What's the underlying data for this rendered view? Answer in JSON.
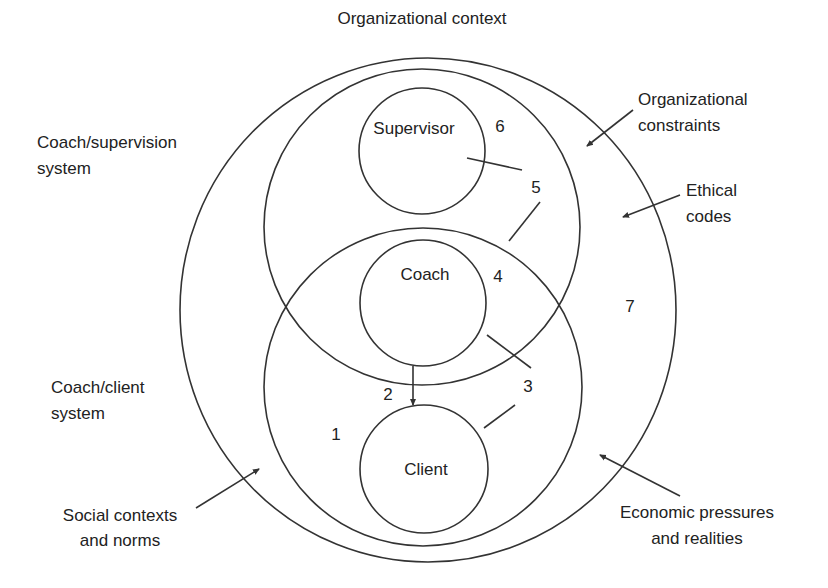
{
  "title": "Organizational context",
  "circles": {
    "supervisor": "Supervisor",
    "coach": "Coach",
    "client": "Client"
  },
  "regions": {
    "r1": "1",
    "r2": "2",
    "r3": "3",
    "r4": "4",
    "r5": "5",
    "r6": "6",
    "r7": "7"
  },
  "left_labels": {
    "supervision_system": [
      "Coach/supervision",
      "system"
    ],
    "client_system": [
      "Coach/client",
      "system"
    ],
    "social": [
      "Social contexts",
      "and norms"
    ]
  },
  "right_labels": {
    "org_constraints": [
      "Organizational",
      "constraints"
    ],
    "ethical": [
      "Ethical",
      "codes"
    ],
    "economic": [
      "Economic pressures",
      "and realities"
    ]
  },
  "colors": {
    "stroke": "#333333",
    "text": "#222222",
    "background": "#ffffff"
  }
}
